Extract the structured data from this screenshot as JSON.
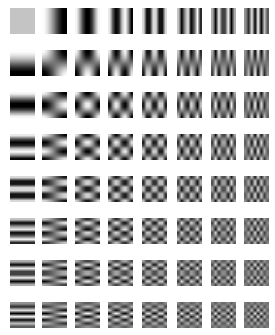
{
  "figure": {
    "type": "dct-basis-functions",
    "rows": 8,
    "cols": 8,
    "block_size": 8,
    "row_meaning": "vertical frequency v (0-7, top to bottom)",
    "col_meaning": "horizontal frequency u (0-7, left to right)",
    "dc_gray": 196,
    "mid_gray": 118,
    "amplitude": 120,
    "layout": {
      "col_x": [
        10,
        42,
        75,
        108,
        142,
        177,
        211,
        244
      ],
      "row_y": [
        8,
        50,
        92,
        134,
        176,
        218,
        260,
        302
      ],
      "cell_width": 25,
      "cell_height": 26
    },
    "background": "#ffffff"
  }
}
